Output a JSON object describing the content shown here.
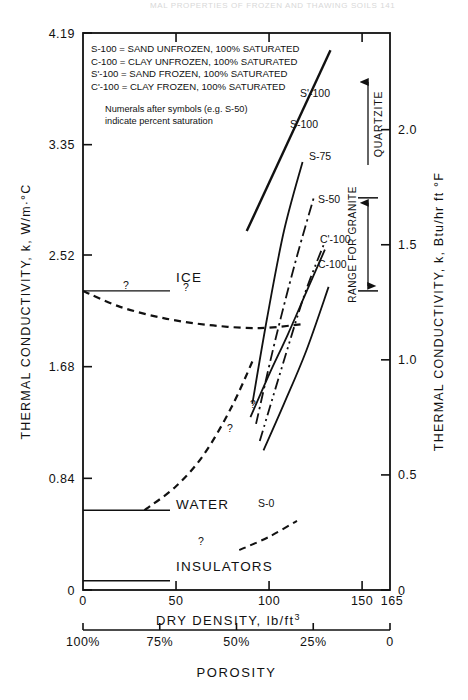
{
  "page": {
    "running_header": "MAL PROPERTIES OF FROZEN AND THAWING SOILS    141"
  },
  "chart_data": {
    "type": "line",
    "title": "",
    "xlabel": "DRY DENSITY, lb/ft",
    "xlabel_sup": "3",
    "xlim": [
      0,
      165
    ],
    "xticks": [
      0,
      50,
      100,
      150
    ],
    "xticklabels": [
      "0",
      "50",
      "100",
      "150"
    ],
    "x_end_label": "165",
    "ylabel": "THERMAL CONDUCTIVITY, k, W/m·°C",
    "ylim": [
      0,
      4.19
    ],
    "yticks": [
      0,
      0.84,
      1.68,
      2.52,
      3.35,
      4.19
    ],
    "yticklabels": [
      "0",
      "0.84",
      "1.68",
      "2.52",
      "3.35",
      "4.19"
    ],
    "y2label": "THERMAL CONDUCTIVITY, k, Btu/hr ft °F",
    "y2lim": [
      0,
      2.42
    ],
    "y2ticks": [
      0,
      0.5,
      1.0,
      1.5,
      2.0
    ],
    "y2ticklabels": [
      "0",
      "0.5",
      "1.0",
      "1.5",
      "2.0"
    ],
    "secondary_axis": {
      "label": "POROSITY",
      "ticks": [
        0,
        25,
        50,
        75,
        100
      ],
      "ticklabels": [
        "100%",
        "75%",
        "50%",
        "25%",
        "0"
      ]
    },
    "grid": false,
    "legend_position": "upper-left-inset",
    "legend_entries": [
      "S-100 = SAND UNFROZEN,  100% SATURATED",
      "C-100 = CLAY UNFROZEN,  100% SATURATED",
      "S'-100 = SAND FROZEN,  100% SATURATED",
      "C'-100 = CLAY FROZEN,  100% SATURATED"
    ],
    "legend_note": [
      "Numerals after symbols (e.g. S-50)",
      "indicate percent saturation"
    ],
    "annotations": [
      {
        "name": "ice-label",
        "text": "ICE",
        "value_w_mk": 2.25
      },
      {
        "name": "water-label",
        "text": "WATER",
        "value_w_mk": 0.6
      },
      {
        "name": "insulators-label",
        "text": "INSULATORS",
        "value_w_mk": 0.07
      },
      {
        "name": "quartzite-label",
        "text": "QUARTZITE"
      },
      {
        "name": "range-granite-label",
        "text": "RANGE FOR GRANITE",
        "range_w_mk": [
          2.25,
          2.95
        ]
      },
      {
        "name": "uncertainty-marker",
        "text": "?"
      }
    ],
    "series": [
      {
        "name": "S'-100",
        "label": "S'-100",
        "style": "solid",
        "width": 2.4,
        "points": [
          [
            88,
            2.7
          ],
          [
            133,
            4.06
          ]
        ]
      },
      {
        "name": "S-100",
        "label": "S-100",
        "style": "solid",
        "width": 1.8,
        "points": [
          [
            91,
            1.4
          ],
          [
            99,
            2.05
          ],
          [
            108,
            2.7
          ],
          [
            118,
            3.22
          ]
        ]
      },
      {
        "name": "S-75",
        "label": "S-75",
        "style": "dashdot",
        "width": 1.8,
        "points": [
          [
            93,
            1.25
          ],
          [
            103,
            1.86
          ],
          [
            114,
            2.46
          ],
          [
            124,
            2.95
          ]
        ]
      },
      {
        "name": "S-50",
        "label": "S-50",
        "style": "dashdotdot",
        "width": 1.8,
        "points": [
          [
            95,
            1.12
          ],
          [
            107,
            1.68
          ],
          [
            119,
            2.22
          ],
          [
            130,
            2.62
          ]
        ]
      },
      {
        "name": "C'-100",
        "label": "C'-100",
        "style": "solid",
        "width": 1.8,
        "points": [
          [
            90,
            1.3
          ],
          [
            100,
            1.62
          ],
          [
            110,
            1.92
          ],
          [
            120,
            2.24
          ],
          [
            130,
            2.56
          ]
        ]
      },
      {
        "name": "C-100",
        "label": "C-100",
        "style": "solid",
        "width": 1.8,
        "points": [
          [
            97,
            1.05
          ],
          [
            108,
            1.4
          ],
          [
            120,
            1.8
          ],
          [
            132,
            2.28
          ]
        ]
      },
      {
        "name": "ice-curve",
        "label": "",
        "style": "dashed",
        "width": 2.2,
        "points": [
          [
            0,
            2.25
          ],
          [
            20,
            2.13
          ],
          [
            45,
            2.04
          ],
          [
            70,
            1.99
          ],
          [
            95,
            1.97
          ],
          [
            118,
            2.0
          ]
        ]
      },
      {
        "name": "water-curve",
        "label": "",
        "style": "dashed",
        "width": 2.2,
        "points": [
          [
            33,
            0.6
          ],
          [
            50,
            0.78
          ],
          [
            65,
            1.02
          ],
          [
            80,
            1.38
          ],
          [
            92,
            1.75
          ]
        ]
      },
      {
        "name": "S-0",
        "label": "S-0",
        "style": "dashed",
        "width": 2.0,
        "points": [
          [
            84,
            0.3
          ],
          [
            100,
            0.4
          ],
          [
            115,
            0.52
          ]
        ]
      }
    ]
  }
}
